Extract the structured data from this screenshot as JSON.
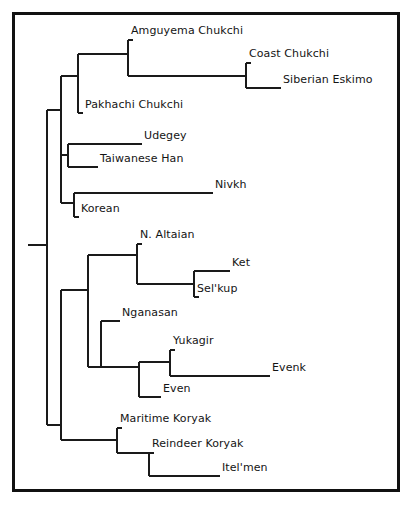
{
  "figure": {
    "type": "phylogenetic-tree",
    "orientation": "left-to-right-rectangular-cladogram",
    "border_color": "#111111",
    "line_color": "#1a1a1a",
    "background": "#ffffff"
  },
  "taxa": [
    {
      "id": "amguyema-chukchi",
      "label": "Amguyema Chukchi",
      "label_x": 131,
      "label_y": 31,
      "tip_x": 128,
      "tip_y": 40
    },
    {
      "id": "coast-chukchi",
      "label": "Coast Chukchi",
      "label_x": 249,
      "label_y": 54,
      "tip_x": 246,
      "tip_y": 63
    },
    {
      "id": "siberian-eskimo",
      "label": "Siberian Eskimo",
      "label_x": 283,
      "label_y": 80,
      "tip_x": 246,
      "tip_y": 88
    },
    {
      "id": "pakhachi-chukchi",
      "label": "Pakhachi Chukchi",
      "label_x": 83,
      "label_y": 105,
      "tip_x": 78,
      "tip_y": 113
    },
    {
      "id": "udegey",
      "label": "Udegey",
      "label_x": 144,
      "label_y": 136,
      "tip_x": 138,
      "tip_y": 144
    },
    {
      "id": "taiwanese-han",
      "label": "Taiwanese Han",
      "label_x": 100,
      "label_y": 159,
      "tip_x": 94,
      "tip_y": 167
    },
    {
      "id": "nivkh",
      "label": "Nivkh",
      "label_x": 215,
      "label_y": 185,
      "tip_x": 209,
      "tip_y": 193
    },
    {
      "id": "korean",
      "label": "Korean",
      "label_x": 80,
      "label_y": 209,
      "tip_x": 74,
      "tip_y": 217
    },
    {
      "id": "n-altaian",
      "label": "N. Altaian",
      "label_x": 140,
      "label_y": 235,
      "tip_x": 137,
      "tip_y": 244
    },
    {
      "id": "ket",
      "label": "Ket",
      "label_x": 232,
      "label_y": 263,
      "tip_x": 226,
      "tip_y": 271
    },
    {
      "id": "selkup",
      "label": "Sel'kup",
      "label_x": 197,
      "label_y": 289,
      "tip_x": 194,
      "tip_y": 297
    },
    {
      "id": "nganasan",
      "label": "Nganasan",
      "label_x": 122,
      "label_y": 313,
      "tip_x": 116,
      "tip_y": 321
    },
    {
      "id": "yukagir",
      "label": "Yukagir",
      "label_x": 173,
      "label_y": 341,
      "tip_x": 170,
      "tip_y": 350
    },
    {
      "id": "evenk",
      "label": "Evenk",
      "label_x": 272,
      "label_y": 368,
      "tip_x": 266,
      "tip_y": 376
    },
    {
      "id": "even",
      "label": "Even",
      "label_x": 163,
      "label_y": 389,
      "tip_x": 157,
      "tip_y": 397
    },
    {
      "id": "maritime-koryak",
      "label": "Maritime Koryak",
      "label_x": 120,
      "label_y": 419,
      "tip_x": 117,
      "tip_y": 428
    },
    {
      "id": "reindeer-koryak",
      "label": "Reindeer Koryak",
      "label_x": 152,
      "label_y": 444,
      "tip_x": 149,
      "tip_y": 453
    },
    {
      "id": "itel-men",
      "label": "Itel'men",
      "label_x": 222,
      "label_y": 468,
      "tip_x": 216,
      "tip_y": 476
    }
  ],
  "clades": [
    {
      "id": "root",
      "x": 47,
      "y_top": 110,
      "y_bottom": 425
    },
    {
      "id": "upper-clade",
      "x": 61,
      "y_top": 76,
      "y_bottom": 203
    },
    {
      "id": "chukchi-eskimo-clade",
      "x": 78,
      "y_top": 54,
      "y_bottom": 113
    },
    {
      "id": "amg-coast-esk-clade",
      "x": 128,
      "y_top": 40,
      "y_bottom": 76
    },
    {
      "id": "coast-eskimo-clade",
      "x": 246,
      "y_top": 63,
      "y_bottom": 88
    },
    {
      "id": "udegey-han-clade",
      "x": 68,
      "y_top": 144,
      "y_bottom": 167
    },
    {
      "id": "nivkh-korean-clade",
      "x": 74,
      "y_top": 193,
      "y_bottom": 217
    },
    {
      "id": "lower-clade",
      "x": 61,
      "y_top": 290,
      "y_bottom": 440
    },
    {
      "id": "siberian-clade",
      "x": 88,
      "y_top": 255,
      "y_bottom": 367
    },
    {
      "id": "altaian-ket-selkup",
      "x": 137,
      "y_top": 244,
      "y_bottom": 284
    },
    {
      "id": "ket-selkup-clade",
      "x": 194,
      "y_top": 271,
      "y_bottom": 297
    },
    {
      "id": "nganasan-tungus",
      "x": 101,
      "y_top": 321,
      "y_bottom": 367
    },
    {
      "id": "yukagir-evenk-even",
      "x": 139,
      "y_top": 362,
      "y_bottom": 397
    },
    {
      "id": "yukagir-evenk-clade",
      "x": 170,
      "y_top": 350,
      "y_bottom": 376
    },
    {
      "id": "koryak-itelmen-clade",
      "x": 117,
      "y_top": 428,
      "y_bottom": 453
    },
    {
      "id": "reindeer-itelmen",
      "x": 149,
      "y_top": 453,
      "y_bottom": 476
    }
  ],
  "root_stub": {
    "x_start": 28,
    "x_end": 47,
    "y": 245
  },
  "branches": [
    {
      "from": "root-stub",
      "x1": 28,
      "x2": 47,
      "y": 245
    },
    {
      "from": "root",
      "x1": 47,
      "x2": 61,
      "y": 110
    },
    {
      "from": "root",
      "x1": 47,
      "x2": 61,
      "y": 425
    },
    {
      "from": "upper",
      "x1": 61,
      "x2": 78,
      "y": 76
    },
    {
      "from": "upper",
      "x1": 61,
      "x2": 68,
      "y": 155
    },
    {
      "from": "upper",
      "x1": 61,
      "x2": 74,
      "y": 203
    },
    {
      "from": "chuk",
      "x1": 78,
      "x2": 128,
      "y": 54
    },
    {
      "from": "chuk",
      "x1": 78,
      "x2": 83,
      "y": 113
    },
    {
      "from": "amg",
      "x1": 128,
      "x2": 131,
      "y": 40
    },
    {
      "from": "amg",
      "x1": 128,
      "x2": 246,
      "y": 76
    },
    {
      "from": "coast",
      "x1": 246,
      "x2": 249,
      "y": 63
    },
    {
      "from": "coast",
      "x1": 246,
      "x2": 281,
      "y": 88
    },
    {
      "from": "udegey",
      "x1": 68,
      "x2": 142,
      "y": 144
    },
    {
      "from": "han",
      "x1": 68,
      "x2": 98,
      "y": 167
    },
    {
      "from": "nivkh",
      "x1": 74,
      "x2": 213,
      "y": 193
    },
    {
      "from": "korean",
      "x1": 74,
      "x2": 79,
      "y": 217
    },
    {
      "from": "lower",
      "x1": 61,
      "x2": 88,
      "y": 290
    },
    {
      "from": "lower",
      "x1": 61,
      "x2": 117,
      "y": 440
    },
    {
      "from": "sib",
      "x1": 88,
      "x2": 137,
      "y": 255
    },
    {
      "from": "sib",
      "x1": 88,
      "x2": 101,
      "y": 367
    },
    {
      "from": "alt",
      "x1": 137,
      "x2": 140,
      "y": 244
    },
    {
      "from": "alt",
      "x1": 137,
      "x2": 194,
      "y": 284
    },
    {
      "from": "ket",
      "x1": 194,
      "x2": 230,
      "y": 271
    },
    {
      "from": "selkup",
      "x1": 194,
      "x2": 197,
      "y": 297
    },
    {
      "from": "ngan",
      "x1": 101,
      "x2": 120,
      "y": 321
    },
    {
      "from": "ngan",
      "x1": 101,
      "x2": 139,
      "y": 367
    },
    {
      "from": "yee",
      "x1": 139,
      "x2": 170,
      "y": 362
    },
    {
      "from": "yee",
      "x1": 139,
      "x2": 161,
      "y": 397
    },
    {
      "from": "yuk",
      "x1": 170,
      "x2": 173,
      "y": 350
    },
    {
      "from": "yuk",
      "x1": 170,
      "x2": 270,
      "y": 376
    },
    {
      "from": "kor",
      "x1": 117,
      "x2": 120,
      "y": 428
    },
    {
      "from": "kor",
      "x1": 117,
      "x2": 149,
      "y": 453
    },
    {
      "from": "rk",
      "x1": 149,
      "x2": 152,
      "y": 453
    },
    {
      "from": "rk",
      "x1": 149,
      "x2": 220,
      "y": 476
    }
  ]
}
